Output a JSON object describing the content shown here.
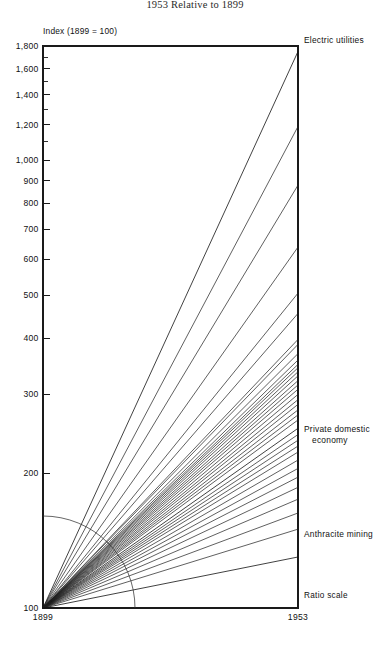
{
  "figure": {
    "title": "1953 Relative to 1899",
    "axis_title": "Index (1899 = 100)",
    "ratio_note": "Ratio scale",
    "x_start_label": "1899",
    "x_end_label": "1953",
    "line_color": "#222222",
    "axis_color": "#1a1a1a"
  },
  "annotations": {
    "top": "Electric utilities",
    "middle_line1": "Private domestic",
    "middle_line2": "economy",
    "low": "Anthracite mining"
  },
  "chart_data": {
    "type": "line",
    "title": "1953 Relative to 1899",
    "subtitle": "Index (1899 = 100)",
    "xlabel": "",
    "ylabel": "Index (1899 = 100)",
    "scale": "log",
    "grid": false,
    "legend": "right-edge labels",
    "x": [
      1899,
      1953
    ],
    "xlim": [
      1899,
      1953
    ],
    "ylim": [
      100,
      1800
    ],
    "ytick_labels": [
      "100",
      "200",
      "300",
      "400",
      "500",
      "600",
      "700",
      "800",
      "900",
      "1,000",
      "1,200",
      "1,400",
      "1,600",
      "1,800"
    ],
    "ytick_values": [
      100,
      200,
      300,
      400,
      500,
      600,
      700,
      800,
      900,
      1000,
      1200,
      1400,
      1600,
      1800
    ],
    "xtick_labels": [
      "1899",
      "1953"
    ],
    "note": "All series indexed to 100 in 1899; straight rays on ratio scale connect 1899 value to 1953 value.",
    "series": [
      {
        "name": "Electric utilities",
        "values": [
          100,
          1750
        ],
        "labeled": true
      },
      {
        "name": "series-02",
        "values": [
          100,
          1190
        ],
        "labeled": false
      },
      {
        "name": "series-03",
        "values": [
          100,
          880
        ],
        "labeled": false
      },
      {
        "name": "series-04",
        "values": [
          100,
          640
        ],
        "labeled": false
      },
      {
        "name": "series-05",
        "values": [
          100,
          505
        ],
        "labeled": false
      },
      {
        "name": "series-06",
        "values": [
          100,
          455
        ],
        "labeled": false
      },
      {
        "name": "series-07",
        "values": [
          100,
          398
        ],
        "labeled": false
      },
      {
        "name": "series-08",
        "values": [
          100,
          388
        ],
        "labeled": false
      },
      {
        "name": "series-09",
        "values": [
          100,
          370
        ],
        "labeled": false
      },
      {
        "name": "series-10",
        "values": [
          100,
          358
        ],
        "labeled": false
      },
      {
        "name": "series-11",
        "values": [
          100,
          350
        ],
        "labeled": false
      },
      {
        "name": "series-12",
        "values": [
          100,
          344
        ],
        "labeled": false
      },
      {
        "name": "series-13",
        "values": [
          100,
          337
        ],
        "labeled": false
      },
      {
        "name": "series-14",
        "values": [
          100,
          330
        ],
        "labeled": false
      },
      {
        "name": "series-15",
        "values": [
          100,
          322
        ],
        "labeled": false
      },
      {
        "name": "series-16",
        "values": [
          100,
          315
        ],
        "labeled": false
      },
      {
        "name": "series-17",
        "values": [
          100,
          308
        ],
        "labeled": false
      },
      {
        "name": "series-18",
        "values": [
          100,
          300
        ],
        "labeled": false
      },
      {
        "name": "series-19",
        "values": [
          100,
          292
        ],
        "labeled": false
      },
      {
        "name": "series-20",
        "values": [
          100,
          285
        ],
        "labeled": false
      },
      {
        "name": "series-21",
        "values": [
          100,
          277
        ],
        "labeled": false
      },
      {
        "name": "series-22",
        "values": [
          100,
          270
        ],
        "labeled": false
      },
      {
        "name": "series-23",
        "values": [
          100,
          263
        ],
        "labeled": false
      },
      {
        "name": "Private domestic economy",
        "values": [
          100,
          252
        ],
        "labeled": true
      },
      {
        "name": "series-25",
        "values": [
          100,
          244
        ],
        "labeled": false
      },
      {
        "name": "series-26",
        "values": [
          100,
          237
        ],
        "labeled": false
      },
      {
        "name": "series-27",
        "values": [
          100,
          230
        ],
        "labeled": false
      },
      {
        "name": "series-28",
        "values": [
          100,
          223
        ],
        "labeled": false
      },
      {
        "name": "series-29",
        "values": [
          100,
          214
        ],
        "labeled": false
      },
      {
        "name": "series-30",
        "values": [
          100,
          205
        ],
        "labeled": false
      },
      {
        "name": "series-31",
        "values": [
          100,
          196
        ],
        "labeled": false
      },
      {
        "name": "series-32",
        "values": [
          100,
          186
        ],
        "labeled": false
      },
      {
        "name": "series-33",
        "values": [
          100,
          175
        ],
        "labeled": false
      },
      {
        "name": "series-34",
        "values": [
          100,
          163
        ],
        "labeled": false
      },
      {
        "name": "series-35",
        "values": [
          100,
          150
        ],
        "labeled": false
      },
      {
        "name": "Anthracite mining",
        "values": [
          100,
          130
        ],
        "labeled": true
      }
    ]
  }
}
